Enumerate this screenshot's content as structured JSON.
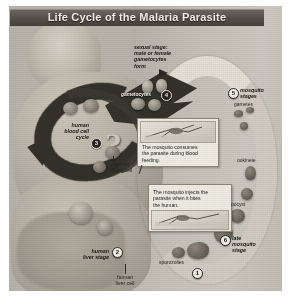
{
  "figure": {
    "title": "Life Cycle of the Malaria Parasite",
    "alt": "Grayscale scientific diagram of the malaria parasite life cycle showing human blood cell cycle, human liver stage, and mosquito stages"
  },
  "labels": {
    "sexual_stage_line1": "sexual stage:",
    "sexual_stage_line2": "male or female",
    "sexual_stage_line3": "gametocytes",
    "sexual_stage_line4": "form",
    "gametocytes": "gametocytes",
    "human_blood_cell_cycle_line1": "human",
    "human_blood_cell_cycle_line2": "blood cell",
    "human_blood_cell_cycle_line3": "cycle",
    "human_blood_cell_line1": "human",
    "human_blood_cell_line2": "blood cell",
    "human_liver_stage_line1": "human",
    "human_liver_stage_line2": "liver stage",
    "human_liver_cell_line1": "human",
    "human_liver_cell_line2": "liver cell",
    "sporozoites": "sporozoites",
    "mosquito_stages_line1": "mosquito",
    "mosquito_stages_line2": "stages",
    "late_mosquito_stage_line1": "late",
    "late_mosquito_stage_line2": "mosquito",
    "late_mosquito_stage_line3": "stage",
    "gametes": "gametes",
    "ookinete": "ookinete",
    "oocyst": "oocyst"
  },
  "insets": {
    "feeding": {
      "caption_line1": "The mosquito consumes",
      "caption_line2": "the parasite during blood",
      "caption_line3": "feeding."
    },
    "injection": {
      "caption_line1": "The mosquito injects the",
      "caption_line2": "parasite when it bites",
      "caption_line3": "the human."
    }
  },
  "badges": {
    "one": "1",
    "two": "2",
    "three": "3",
    "four": "4",
    "five": "5",
    "six": "6"
  },
  "colors": {
    "title_bar": "#4f4a43",
    "title_text": "#f2efe9",
    "plate": "#b9b5ad",
    "dark_cycle": "#34312b",
    "mosquito_arc": "#e4e0d6",
    "page": "#ffffff"
  }
}
